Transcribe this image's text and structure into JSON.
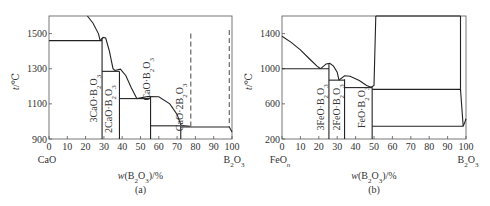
{
  "chart_data": [
    {
      "id": "a",
      "type": "line",
      "title": "",
      "caption": "(a)",
      "xlabel": "w(B2O3)/%",
      "ylabel": "t/℃",
      "xlim": [
        0,
        100
      ],
      "ylim": [
        900,
        1600
      ],
      "xticks": [
        0,
        10,
        20,
        30,
        40,
        50,
        60,
        70,
        80,
        90,
        100
      ],
      "yticks": [
        900,
        1100,
        1300,
        1500
      ],
      "x_end_labels": {
        "left": "CaO",
        "right": "B2O3"
      },
      "grid": false,
      "frame": {
        "left": 49,
        "right": 232,
        "top": 16,
        "bottom": 139
      },
      "liquidus": [
        [
          [
            21,
            1600
          ],
          [
            24,
            1560
          ],
          [
            27,
            1500
          ],
          [
            28,
            1460
          ]
        ],
        [
          [
            28,
            1460
          ],
          [
            29.5,
            1478
          ],
          [
            31,
            1475
          ],
          [
            33,
            1400
          ],
          [
            35,
            1300
          ],
          [
            36,
            1290
          ]
        ],
        [
          [
            36,
            1290
          ],
          [
            39,
            1298
          ],
          [
            42,
            1260
          ],
          [
            45,
            1190
          ],
          [
            48,
            1130
          ]
        ],
        [
          [
            48,
            1130
          ],
          [
            54,
            1142
          ],
          [
            60,
            1140
          ],
          [
            66,
            1100
          ],
          [
            70,
            1040
          ],
          [
            72,
            980
          ],
          [
            73,
            976
          ]
        ],
        [
          [
            73,
            976
          ],
          [
            77,
            972
          ]
        ]
      ],
      "horizontal_lines": [
        {
          "y": 1460,
          "x1": 0,
          "x2": 29
        },
        {
          "y": 1285,
          "x1": 29,
          "x2": 38.5
        },
        {
          "y": 1130,
          "x1": 38.5,
          "x2": 55.5
        },
        {
          "y": 975,
          "x1": 55.5,
          "x2": 72
        },
        {
          "y": 968,
          "x1": 72,
          "x2": 98.5
        }
      ],
      "compound_lines": [
        {
          "x": 29,
          "y_top": 1475,
          "label": "3CaO·B2O3"
        },
        {
          "x": 38.5,
          "y_top": 1285,
          "label": "2CaO·B2O3"
        },
        {
          "x": 55.5,
          "y_top": 1140,
          "label": "CaO·B2O3"
        },
        {
          "x": 72,
          "y_top": 975,
          "label": "CaO·2B2O3"
        }
      ],
      "dashed_lines": [
        {
          "x": 77.5,
          "y1": 1500,
          "y2": 968
        },
        {
          "x": 98.5,
          "y1": 1520,
          "y2": 968
        }
      ],
      "tail": [
        [
          98.5,
          968
        ],
        [
          100,
          940
        ]
      ],
      "phase_labels": [
        {
          "text": "3CaO·B2O3",
          "x": 26,
          "y": 1130,
          "rotate": -90
        },
        {
          "text": "2CaO·B2O3",
          "x": 34.5,
          "y": 1070,
          "rotate": -90
        },
        {
          "text": "CaO·B2O3",
          "x": 55,
          "y": 1240,
          "rotate": -90
        },
        {
          "text": "CaO·2B2O3",
          "x": 73.5,
          "y": 1080,
          "rotate": -90
        }
      ]
    },
    {
      "id": "b",
      "type": "line",
      "title": "",
      "caption": "(b)",
      "xlabel": "w(B2O3)/%",
      "ylabel": "t/℃",
      "xlim": [
        0,
        100
      ],
      "ylim": [
        200,
        1600
      ],
      "xticks": [
        0,
        10,
        20,
        30,
        40,
        50,
        60,
        70,
        80,
        90,
        100
      ],
      "yticks": [
        200,
        600,
        1000,
        1400
      ],
      "x_end_labels": {
        "left": "FeOn",
        "right": "B2O3"
      },
      "grid": false,
      "frame": {
        "left": 282,
        "right": 466,
        "top": 16,
        "bottom": 139
      },
      "liquidus": [
        [
          [
            0,
            1370
          ],
          [
            5,
            1300
          ],
          [
            10,
            1215
          ],
          [
            15,
            1110
          ],
          [
            19,
            1030
          ],
          [
            21,
            1000
          ]
        ],
        [
          [
            21,
            1000
          ],
          [
            24,
            1055
          ],
          [
            26,
            1060
          ],
          [
            28,
            1030
          ],
          [
            30,
            960
          ],
          [
            31,
            870
          ]
        ],
        [
          [
            31,
            870
          ],
          [
            34,
            920
          ],
          [
            37,
            915
          ],
          [
            42,
            865
          ],
          [
            46,
            810
          ],
          [
            48.5,
            790
          ]
        ],
        [
          [
            48.5,
            790
          ],
          [
            50,
            810
          ],
          [
            51,
            1600
          ]
        ]
      ],
      "horizontal_lines": [
        {
          "y": 1000,
          "x1": 0,
          "x2": 25.5
        },
        {
          "y": 870,
          "x1": 25.5,
          "x2": 34
        },
        {
          "y": 785,
          "x1": 34,
          "x2": 49
        },
        {
          "y": 765,
          "x1": 49,
          "x2": 97
        },
        {
          "y": 345,
          "x1": 49,
          "x2": 98.5
        },
        {
          "y": 1600,
          "x1": 51,
          "x2": 97
        }
      ],
      "compound_lines": [
        {
          "x": 25.5,
          "y_top": 1050,
          "label": "3FeO·B2O3"
        },
        {
          "x": 34,
          "y_top": 880,
          "label": "2FeO·B2O3"
        },
        {
          "x": 49,
          "y_top": 790,
          "label": "FeO·B2O3"
        }
      ],
      "other_lines": [
        [
          [
            97,
            1600
          ],
          [
            97,
            765
          ],
          [
            98.5,
            345
          ]
        ],
        [
          [
            98.5,
            345
          ],
          [
            99.5,
            400
          ],
          [
            100,
            430
          ]
        ]
      ],
      "phase_labels": [
        {
          "text": "3FeO·B2O3",
          "x": 23,
          "y": 560,
          "rotate": -90
        },
        {
          "text": "2FeO·B2O3",
          "x": 31.5,
          "y": 560,
          "rotate": -90
        },
        {
          "text": "FeO·B2O3",
          "x": 45,
          "y": 560,
          "rotate": -90
        }
      ]
    }
  ]
}
